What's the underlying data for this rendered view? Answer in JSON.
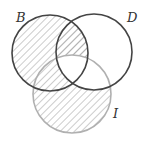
{
  "diagram": {
    "type": "venn",
    "sets": [
      {
        "id": "B",
        "label": "B",
        "cx": 50,
        "cy": 53,
        "r": 38,
        "stroke": "#444444"
      },
      {
        "id": "D",
        "label": "D",
        "cx": 94,
        "cy": 52,
        "r": 38,
        "stroke": "#444444"
      },
      {
        "id": "I",
        "label": "I",
        "cx": 72,
        "cy": 94,
        "r": 39,
        "stroke": "#aaaaaa"
      }
    ],
    "shaded_regions": [
      "B only",
      "B∩D not I",
      "B∩I not D",
      "I only"
    ],
    "unshaded_regions": [
      "D only",
      "D∩I not B",
      "B∩D∩I"
    ],
    "hatch_color": "#999999"
  }
}
